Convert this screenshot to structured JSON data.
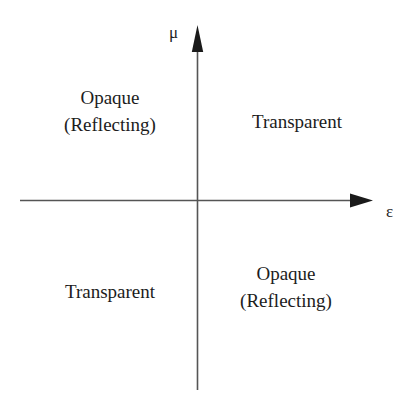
{
  "figure": {
    "type": "diagram",
    "background_color": "#ffffff",
    "line_color": "#555555",
    "text_color": "#1c1c1c"
  },
  "axes": {
    "horizontal": {
      "symbol": "ε",
      "name": "epsilon-axis",
      "arrow_direction": "right"
    },
    "vertical": {
      "symbol": "μ",
      "name": "mu-axis",
      "arrow_direction": "up"
    }
  },
  "quadrants": [
    {
      "id": "quadrant-1",
      "position": "upper-right",
      "lines": [
        "Transparent"
      ]
    },
    {
      "id": "quadrant-2",
      "position": "upper-left",
      "lines": [
        "Opaque",
        "(Reflecting)"
      ]
    },
    {
      "id": "quadrant-3",
      "position": "lower-left",
      "lines": [
        "Transparent"
      ]
    },
    {
      "id": "quadrant-4",
      "position": "lower-right",
      "lines": [
        "Opaque",
        "(Reflecting)"
      ]
    }
  ]
}
